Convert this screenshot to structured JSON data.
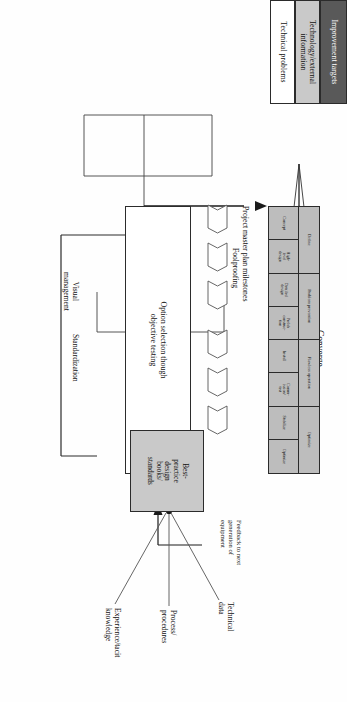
{
  "diagram": {
    "arrow": {
      "diverge_label": "Diverge",
      "converge_label": "Converge"
    },
    "inputs": [
      {
        "label": "Improvement targets",
        "fill": "#595959",
        "text_color": "#ffffff"
      },
      {
        "label": "Technology/external information",
        "fill": "#c9c9c9",
        "text_color": "#111111"
      },
      {
        "label": "Technical problems",
        "fill": "#ffffff",
        "text_color": "#111111"
      }
    ],
    "phase_table": {
      "header_fill": "#bdbdbd",
      "stages": [
        {
          "label": "Define",
          "span": 2
        },
        {
          "label": "Problem prevention",
          "span": 2
        },
        {
          "label": "Flawless operation",
          "span": 2
        },
        {
          "label": "Optimize",
          "span": 2
        }
      ],
      "steps": [
        "Concept",
        "High-\nlevel\ndesign",
        "Detailed\ndesign",
        "Prelab\nconstruc-\ntion",
        "Install",
        "Comm-\nission/\ntest",
        "Stabilize",
        "Optimize"
      ]
    },
    "milestones": {
      "label": "Project master plan milestones",
      "count": 6
    },
    "option_selection": {
      "label": "Option selection though\nobjective testing"
    },
    "enablers": [
      "Foolproofing",
      "Visual\nmanagement",
      "Standardization"
    ],
    "best_practice": {
      "label": "Best-\npractice\ndesign\nbooks/\nstandards"
    },
    "knowledge_sources": [
      "Technical\ndata",
      "Process/\nprocedures",
      "Experience/tacit\nknowledge"
    ],
    "feedback": {
      "label": "Feedback to next\ngeneration of\nequipment"
    }
  }
}
